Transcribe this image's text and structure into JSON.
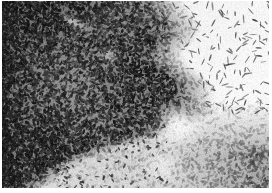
{
  "image": {
    "kind": "histology-micrograph",
    "modality": "brightfield-light-microscopy",
    "stain_appearance": "grayscale",
    "width": 272,
    "height": 193,
    "caption": "",
    "has_visible_text": false,
    "has_scale_bar": false,
    "has_border_frame": false,
    "background_color": "#ffffff",
    "margins": {
      "left_px": 2,
      "right_px": 3,
      "top_px": 1,
      "bottom_px": 5,
      "margin_color": "#ffffff"
    },
    "tone": {
      "darkest": "#141414",
      "dark": "#2e2e2e",
      "mid_dark": "#4d4d4d",
      "mid": "#777777",
      "light": "#b8b8b8",
      "paper": "#f2f2f2",
      "void": "#ffffff"
    },
    "regions": [
      {
        "name": "dense-cellular-zone",
        "label": "Dense hypercellular tissue",
        "position": "left and lower-left",
        "bounds": [
          0,
          0,
          150,
          193
        ],
        "density": "very-high",
        "mean_gray": "#3a3a3a"
      },
      {
        "name": "white-void-lumen",
        "label": "Acellular white lumen / cavity",
        "position": "upper-right",
        "bounds": [
          150,
          0,
          122,
          115
        ],
        "density": "very-low",
        "mean_gray": "#fbfbfb"
      },
      {
        "name": "transition-boundary",
        "label": "Tissue to lumen interface",
        "position": "diagonal, center-right",
        "bounds": [
          118,
          0,
          70,
          125
        ],
        "density": "gradient",
        "mean_gray": "#8a8a8a"
      },
      {
        "name": "moderate-cellular-zone",
        "label": "Moderately cellular tissue",
        "position": "lower-right",
        "bounds": [
          150,
          110,
          122,
          83
        ],
        "density": "medium",
        "mean_gray": "#8f8f8f"
      },
      {
        "name": "pale-streak",
        "label": "Pale diagonal streak",
        "position": "upper-left-center",
        "bounds": [
          58,
          4,
          28,
          34
        ],
        "density": "low",
        "mean_gray": "#c4c4c4"
      },
      {
        "name": "white-wedge-notch",
        "label": "White wedge indentation",
        "position": "lower-center-right",
        "bounds": [
          160,
          105,
          46,
          55
        ],
        "density": "very-low",
        "mean_gray": "#f6f6f6"
      }
    ],
    "nuclei": {
      "shape": "elongated-ovoid",
      "color_dark": "#1d1d1d",
      "color_mid": "#4a4a4a",
      "approx_length_px": 4,
      "approx_width_px": 2,
      "total_estimate": 9000
    }
  }
}
